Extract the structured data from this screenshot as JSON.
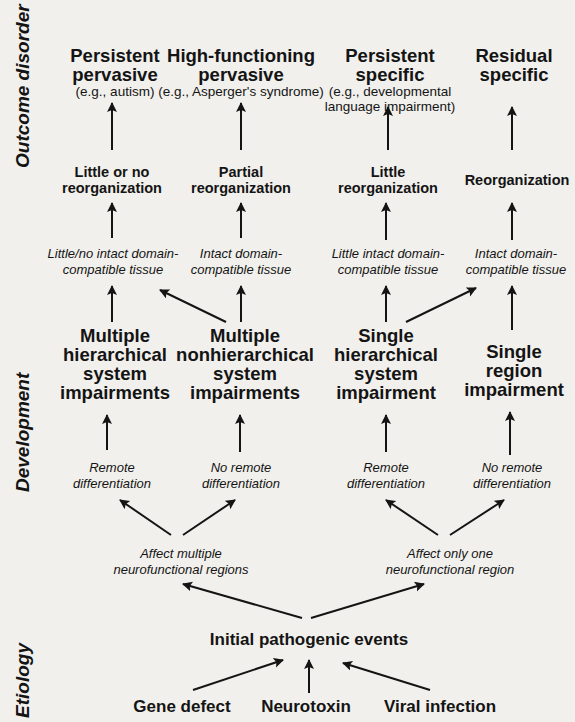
{
  "stages": {
    "outcome": "Outcome disorder",
    "development": "Development",
    "etiology": "Etiology"
  },
  "outcomes": [
    {
      "title": [
        "Persistent",
        "pervasive"
      ],
      "example": [
        "(e.g., autism)"
      ]
    },
    {
      "title": [
        "High-functioning",
        "pervasive"
      ],
      "example": [
        "(e.g., Asperger's syndrome)"
      ]
    },
    {
      "title": [
        "Persistent",
        "specific"
      ],
      "example": [
        "(e.g., developmental",
        "language impairment)"
      ]
    },
    {
      "title": [
        "Residual",
        "specific"
      ],
      "example": []
    }
  ],
  "reorganization": [
    [
      "Little or no",
      "reorganization"
    ],
    [
      "Partial",
      "reorganization"
    ],
    [
      "Little",
      "reorganization"
    ],
    [
      "Reorganization"
    ]
  ],
  "tissue": [
    [
      "Little/no intact domain-",
      "compatible tissue"
    ],
    [
      "Intact domain-",
      "compatible tissue"
    ],
    [
      "Little intact domain-",
      "compatible tissue"
    ],
    [
      "Intact domain-",
      "compatible tissue"
    ]
  ],
  "impairments": [
    [
      "Multiple",
      "hierarchical",
      "system",
      "impairments"
    ],
    [
      "Multiple",
      "nonhierarchical",
      "system",
      "impairments"
    ],
    [
      "Single",
      "hierarchical",
      "system",
      "impairment"
    ],
    [
      "Single",
      "region",
      "impairment"
    ]
  ],
  "differentiation": [
    [
      "Remote",
      "differentiation"
    ],
    [
      "No remote",
      "differentiation"
    ],
    [
      "Remote",
      "differentiation"
    ],
    [
      "No remote",
      "differentiation"
    ]
  ],
  "regions": [
    [
      "Affect multiple",
      "neurofunctional regions"
    ],
    [
      "Affect only one",
      "neurofunctional region"
    ]
  ],
  "initial_event": "Initial pathogenic events",
  "causes": [
    "Gene defect",
    "Neurotoxin",
    "Viral infection"
  ],
  "colors": {
    "background": "#f1f0ec",
    "ink": "#141414"
  }
}
